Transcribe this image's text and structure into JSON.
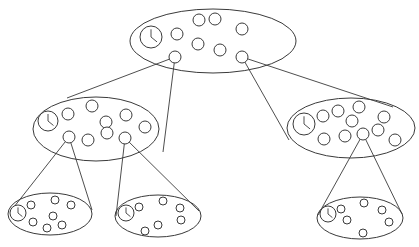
{
  "diagram": {
    "type": "hierarchical-tree",
    "colors": {
      "stroke": "#3a3a3a",
      "background": "#ffffff"
    },
    "nodes": [
      {
        "id": "root",
        "ellipse": {
          "cx": 213,
          "cy": 41,
          "rx": 83,
          "ry": 32
        },
        "clock": {
          "cx": 151,
          "cy": 37,
          "r": 11
        },
        "circle_r": 6,
        "circles": [
          [
            177,
            34
          ],
          [
            199,
            20
          ],
          [
            215,
            19
          ],
          [
            242,
            29
          ],
          [
            198,
            44
          ],
          [
            220,
            50
          ],
          [
            175,
            57
          ],
          [
            242,
            57
          ]
        ]
      },
      {
        "id": "left",
        "ellipse": {
          "cx": 96,
          "cy": 129,
          "rx": 63,
          "ry": 32
        },
        "clock": {
          "cx": 48,
          "cy": 121,
          "r": 10
        },
        "circle_r": 6,
        "circles": [
          [
            68,
            114
          ],
          [
            92,
            106
          ],
          [
            106,
            122
          ],
          [
            126,
            115
          ],
          [
            145,
            127
          ],
          [
            69,
            137
          ],
          [
            88,
            140
          ],
          [
            107,
            133
          ],
          [
            125,
            138
          ]
        ]
      },
      {
        "id": "right",
        "ellipse": {
          "cx": 351,
          "cy": 128,
          "rx": 64,
          "ry": 30
        },
        "clock": {
          "cx": 304,
          "cy": 124,
          "r": 11
        },
        "circle_r": 6,
        "circles": [
          [
            323,
            116
          ],
          [
            338,
            111
          ],
          [
            359,
            107
          ],
          [
            352,
            121
          ],
          [
            384,
            117
          ],
          [
            324,
            139
          ],
          [
            345,
            136
          ],
          [
            363,
            134
          ],
          [
            378,
            130
          ],
          [
            395,
            140
          ]
        ]
      },
      {
        "id": "left-left",
        "ellipse": {
          "cx": 50,
          "cy": 214,
          "rx": 42,
          "ry": 21
        },
        "clock": {
          "cx": 18,
          "cy": 213,
          "r": 8
        },
        "circle_r": 4,
        "circles": [
          [
            31,
            205
          ],
          [
            55,
            200
          ],
          [
            71,
            205
          ],
          [
            53,
            216
          ],
          [
            33,
            222
          ],
          [
            47,
            228
          ],
          [
            62,
            225
          ]
        ]
      },
      {
        "id": "left-right",
        "ellipse": {
          "cx": 158,
          "cy": 216,
          "rx": 43,
          "ry": 21
        },
        "clock": {
          "cx": 126,
          "cy": 213,
          "r": 8
        },
        "circle_r": 4,
        "circles": [
          [
            139,
            207
          ],
          [
            163,
            201
          ],
          [
            180,
            208
          ],
          [
            181,
            220
          ],
          [
            158,
            225
          ],
          [
            145,
            231
          ]
        ]
      },
      {
        "id": "right-child",
        "ellipse": {
          "cx": 360,
          "cy": 218,
          "rx": 43,
          "ry": 21
        },
        "clock": {
          "cx": 328,
          "cy": 214,
          "r": 8
        },
        "circle_r": 4,
        "circles": [
          [
            341,
            209
          ],
          [
            364,
            203
          ],
          [
            382,
            210
          ],
          [
            347,
            220
          ],
          [
            389,
            222
          ],
          [
            363,
            233
          ]
        ]
      }
    ],
    "edges": [
      {
        "from": "root",
        "to": "left",
        "apex": [
          175,
          57
        ],
        "ends": [
          [
            67,
            98
          ],
          [
            163,
            152
          ]
        ]
      },
      {
        "from": "root",
        "to": "right",
        "apex": [
          242,
          57
        ],
        "ends": [
          [
            289,
            140
          ],
          [
            393,
            107
          ]
        ]
      },
      {
        "from": "left",
        "to": "left-left",
        "apex": [
          69,
          137
        ],
        "ends": [
          [
            10,
            212
          ],
          [
            92,
            210
          ]
        ]
      },
      {
        "from": "left",
        "to": "left-right",
        "apex": [
          125,
          138
        ],
        "ends": [
          [
            116,
            216
          ],
          [
            199,
            211
          ]
        ]
      },
      {
        "from": "right",
        "to": "right-child",
        "apex": [
          363,
          134
        ],
        "ends": [
          [
            318,
            215
          ],
          [
            402,
            214
          ]
        ]
      }
    ]
  }
}
